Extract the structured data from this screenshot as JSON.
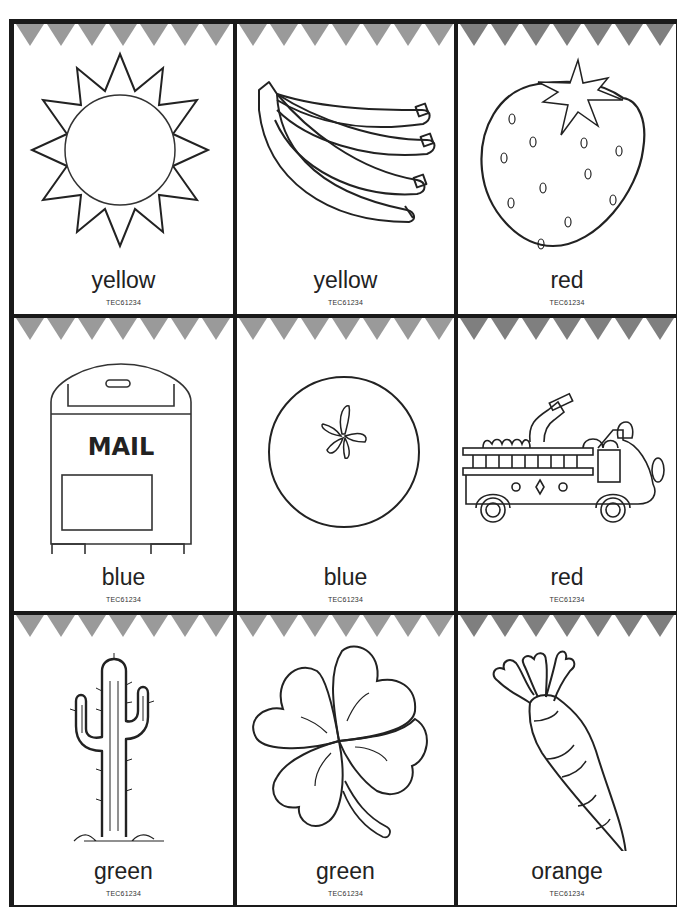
{
  "sheet": {
    "pennant_colors": [
      "#9a9a9a",
      "#9a9a9a",
      "#7f7f7f"
    ],
    "pennant_count": 7,
    "cards": [
      {
        "label": "yellow",
        "code": "TEC61234",
        "picture": "sun"
      },
      {
        "label": "yellow",
        "code": "TEC61234",
        "picture": "bananas"
      },
      {
        "label": "red",
        "code": "TEC61234",
        "picture": "strawberry"
      },
      {
        "label": "blue",
        "code": "TEC61234",
        "picture": "mailbox",
        "picture_text": "MAIL"
      },
      {
        "label": "blue",
        "code": "TEC61234",
        "picture": "blueberry"
      },
      {
        "label": "red",
        "code": "TEC61234",
        "picture": "fire-truck"
      },
      {
        "label": "green",
        "code": "TEC61234",
        "picture": "cactus"
      },
      {
        "label": "green",
        "code": "TEC61234",
        "picture": "four-leaf-clover"
      },
      {
        "label": "orange",
        "code": "TEC61234",
        "picture": "carrot"
      }
    ]
  }
}
